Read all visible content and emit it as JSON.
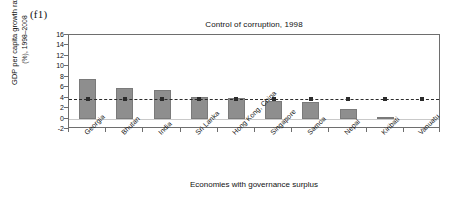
{
  "panel": {
    "label": "(f1)"
  },
  "axis_titles": {
    "y_line1": "GDP per capita growth rate",
    "y_line2": "(%), 1998–2008",
    "x": "Economies with governance surplus"
  },
  "colors": {
    "bar_fill": "#8e8e8e",
    "bar_edge": "#7a7a7a",
    "axis": "#6e6e6e",
    "reference_line": "#2b2b2b",
    "zero_line": "#c9c9c9",
    "background": "#ffffff"
  },
  "chart_data": {
    "type": "bar",
    "title": "Control of corruption, 1998",
    "xlabel": "Economies with governance surplus",
    "ylabel": "GDP per capita growth rate (%), 1998–2008",
    "categories": [
      "Georgia",
      "Bhutan",
      "India",
      "Sri Lanka",
      "Hong Kong, China",
      "Singapore",
      "Samoa",
      "Nepal",
      "Kiribati",
      "Vanuatu"
    ],
    "values": [
      7.5,
      5.8,
      5.5,
      4.1,
      4.0,
      3.4,
      3.2,
      1.8,
      0.3,
      0.0
    ],
    "ylim": [
      -2,
      16
    ],
    "yticks": [
      16,
      14,
      12,
      10,
      8,
      6,
      4,
      2,
      0,
      -2
    ],
    "ytick_labels": [
      "16",
      "14",
      "12",
      "10",
      "8",
      "6",
      "4",
      "2",
      "0",
      "-2"
    ],
    "grid": false,
    "legend": null,
    "reference_line": {
      "value": 3.7,
      "style": "dashed-with-markers",
      "label": ""
    },
    "reference_markers": [
      3.7,
      3.7,
      3.7,
      3.7,
      3.7,
      3.7,
      3.7,
      3.7,
      3.7,
      3.7
    ]
  }
}
